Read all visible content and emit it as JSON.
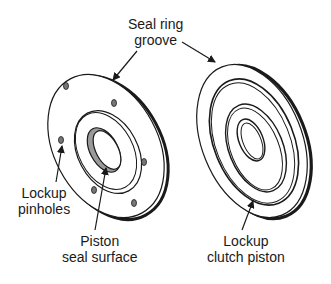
{
  "diagram": {
    "labels": {
      "seal_ring_groove": {
        "line1": "Seal ring",
        "line2": "groove"
      },
      "lockup_pinholes": {
        "line1": "Lockup",
        "line2": "pinholes"
      },
      "piston_seal_surface": {
        "line1": "Piston",
        "line2": "seal surface"
      },
      "lockup_clutch_piston": {
        "line1": "Lockup",
        "line2": "clutch piston"
      }
    },
    "colors": {
      "line": "#1a1a1a",
      "shade": "#999999",
      "background": "#ffffff"
    }
  }
}
